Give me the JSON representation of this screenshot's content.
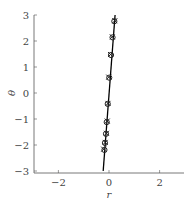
{
  "chart_data": {
    "type": "scatter",
    "title": "",
    "xlabel": "r",
    "ylabel": "θ",
    "xlim": [
      -3,
      3
    ],
    "ylim": [
      -3,
      3
    ],
    "xticks": [
      -2,
      0,
      2
    ],
    "yticks": [
      -3,
      -2,
      -1,
      0,
      1,
      2,
      3
    ],
    "xtick_labels": [
      "−2",
      "0",
      "2"
    ],
    "ytick_labels": [
      "−3",
      "−2",
      "−1",
      "0",
      "1",
      "2",
      "3"
    ],
    "grid": false,
    "legend": null,
    "series": [
      {
        "name": "fit line",
        "type": "line",
        "color": "#000000",
        "points": [
          [
            -0.23,
            -3
          ],
          [
            0.24,
            3
          ]
        ]
      },
      {
        "name": "circle markers",
        "type": "scatter",
        "marker": "o",
        "color": "#222222",
        "points": [
          [
            0.21,
            2.76
          ],
          [
            0.14,
            2.14
          ],
          [
            0.08,
            1.46
          ],
          [
            0.01,
            0.59
          ],
          [
            -0.05,
            -0.42
          ],
          [
            -0.09,
            -1.12
          ],
          [
            -0.12,
            -1.57
          ],
          [
            -0.16,
            -1.92
          ],
          [
            -0.18,
            -2.19
          ]
        ]
      },
      {
        "name": "cross markers",
        "type": "scatter",
        "marker": "x",
        "color": "#222222",
        "points": [
          [
            0.23,
            2.78
          ],
          [
            0.13,
            2.16
          ],
          [
            0.06,
            1.48
          ],
          [
            -0.01,
            0.61
          ],
          [
            -0.04,
            -0.4
          ],
          [
            -0.07,
            -1.08
          ],
          [
            -0.1,
            -1.55
          ],
          [
            -0.15,
            -1.9
          ],
          [
            -0.21,
            -2.16
          ]
        ]
      }
    ]
  }
}
